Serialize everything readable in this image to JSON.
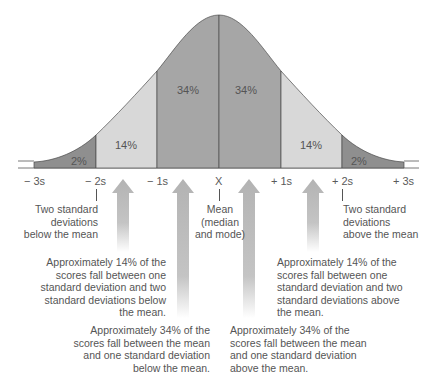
{
  "diagram": {
    "type": "normal-distribution",
    "axis_labels": [
      "− 3s",
      "− 2s",
      "− 1s",
      "X",
      "+ 1s",
      "+ 2s",
      "+ 3s"
    ],
    "regions": [
      {
        "label": "2%",
        "from": "-3s",
        "to": "-2s",
        "color": "#8f8f8f"
      },
      {
        "label": "14%",
        "from": "-2s",
        "to": "-1s",
        "color": "#d8d8d8"
      },
      {
        "label": "34%",
        "from": "-1s",
        "to": "X",
        "color": "#a6a6a6"
      },
      {
        "label": "34%",
        "from": "X",
        "to": "+1s",
        "color": "#a6a6a6"
      },
      {
        "label": "14%",
        "from": "+1s",
        "to": "+2s",
        "color": "#d8d8d8"
      },
      {
        "label": "2%",
        "from": "+2s",
        "to": "+3s",
        "color": "#8f8f8f"
      }
    ],
    "annotations": {
      "minus2": "Two standard\ndeviations\nbelow the mean",
      "mean": "Mean\n(median\nand mode)",
      "plus2": "Two standard\ndeviations\nabove the mean",
      "arrow_minus14": "Approximately 14% of the\nscores fall between one\nstandard deviation and two\nstandard deviations below\nthe mean.",
      "arrow_plus14": "Approximately 14% of the\nscores fall between one\nstandard deviation and two\nstandard deviations above\nthe mean.",
      "arrow_minus34": "Approximately 34% of the\nscores fall between the mean\nand one standard deviation\nbelow the mean.",
      "arrow_plus34": "Approximately 34% of the\nscores fall between the mean\nand one standard deviation\nabove the mean."
    },
    "colors": {
      "outline": "#4a4a4a",
      "tail": "#8f8f8f",
      "mid": "#d8d8d8",
      "center": "#a6a6a6",
      "arrow": "#b5b5b5"
    }
  }
}
